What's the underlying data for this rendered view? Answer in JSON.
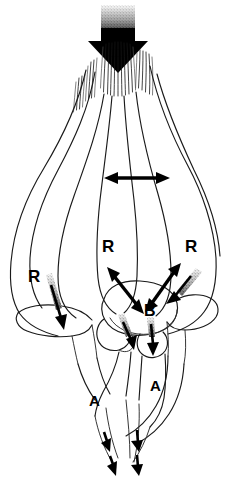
{
  "figure": {
    "background_color": "#ffffff",
    "ink_color": "#000000",
    "width": 230,
    "height": 479
  },
  "labels": [
    {
      "id": "r-center",
      "text": "R",
      "x": 102,
      "y": 238,
      "meaning": "resistance-center"
    },
    {
      "id": "r-right",
      "text": "R",
      "x": 185,
      "y": 238,
      "meaning": "resistance-right"
    },
    {
      "id": "r-left",
      "text": "R",
      "x": 28,
      "y": 268,
      "meaning": "resistance-left"
    },
    {
      "id": "b-center",
      "text": "B",
      "x": 144,
      "y": 303,
      "meaning": "body-load"
    },
    {
      "id": "a-left",
      "text": "A",
      "x": 89,
      "y": 393,
      "meaning": "articular-left"
    },
    {
      "id": "a-right",
      "text": "A",
      "x": 150,
      "y": 378,
      "meaning": "articular-right"
    }
  ],
  "arrows": {
    "load_arrow": {
      "name": "top-load-arrow",
      "direction": "down",
      "description": "thick black block arrow applying axial load at top"
    },
    "transverse_arrow": {
      "name": "horizontal-double-arrow",
      "direction": "bidirectional-horizontal",
      "description": "double headed arrow spanning mid-section"
    },
    "oblique_left": {
      "name": "oblique-double-arrow-left",
      "direction": "bidirectional-diagonal",
      "description": "double headed arrow from upper-left toward B"
    },
    "oblique_right": {
      "name": "oblique-double-arrow-right",
      "direction": "bidirectional-diagonal",
      "description": "double headed arrow from upper-right toward B"
    },
    "left_descending": {
      "name": "left-descending-arrow",
      "direction": "down-right",
      "description": "stippled-tail arrow descending on left transverse process"
    },
    "right_descending": {
      "name": "right-descending-arrow",
      "direction": "down-left",
      "description": "stippled-tail arrow descending on right transverse process"
    },
    "pedicle_left": {
      "name": "pedicle-arrow-left",
      "direction": "down-right",
      "description": "short stippled-tail arrow into left pedicle"
    },
    "pedicle_right": {
      "name": "pedicle-arrow-right",
      "direction": "down",
      "description": "short stippled-tail arrow into right pedicle"
    },
    "outflow": [
      {
        "name": "outflow-arrow-1",
        "direction": "down"
      },
      {
        "name": "outflow-arrow-2",
        "direction": "down"
      },
      {
        "name": "outflow-arrow-3",
        "direction": "down"
      },
      {
        "name": "outflow-arrow-4",
        "direction": "down"
      }
    ]
  }
}
